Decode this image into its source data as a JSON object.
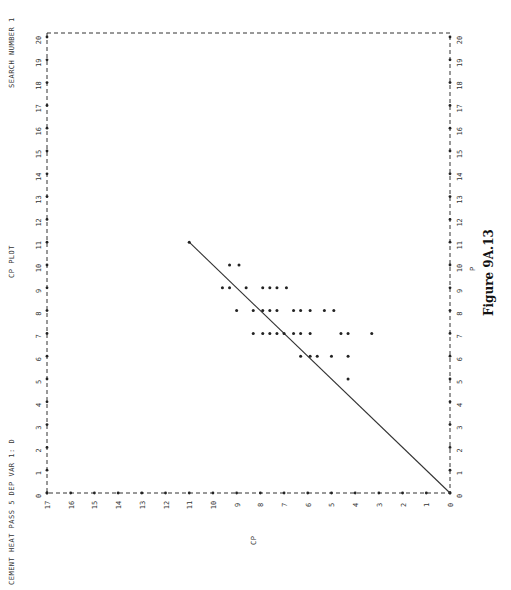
{
  "header": {
    "left": "CEMENT HEAT PASS 5   DEP VAR 1: D",
    "center": "CP PLOT",
    "right": "SEARCH NUMBER 1"
  },
  "caption": "Figure 9A.13",
  "chart_data": {
    "type": "scatter",
    "title": "CP PLOT",
    "orientation": "rotated 90 degrees counter-clockwise on page",
    "xlabel": "P",
    "ylabel": "CP",
    "xlim": [
      0,
      20
    ],
    "ylim": [
      0,
      17
    ],
    "x_ticks": [
      0,
      1,
      2,
      3,
      4,
      5,
      6,
      7,
      8,
      9,
      10,
      11,
      12,
      13,
      14,
      15,
      16,
      17,
      18,
      19,
      20
    ],
    "y_ticks": [
      0,
      1,
      2,
      3,
      4,
      5,
      6,
      7,
      8,
      9,
      10,
      11,
      12,
      13,
      14,
      15,
      16,
      17
    ],
    "grid": false,
    "reference_line": {
      "label": "CP = P",
      "from": [
        0,
        0
      ],
      "to": [
        11,
        11
      ]
    },
    "series": [
      {
        "name": "subsets",
        "points": [
          {
            "p": 11,
            "cp": 11.0
          },
          {
            "p": 10,
            "cp": 9.3
          },
          {
            "p": 10,
            "cp": 8.9
          },
          {
            "p": 9,
            "cp": 9.6
          },
          {
            "p": 9,
            "cp": 9.3
          },
          {
            "p": 9,
            "cp": 8.6
          },
          {
            "p": 9,
            "cp": 7.9
          },
          {
            "p": 9,
            "cp": 7.6
          },
          {
            "p": 9,
            "cp": 7.3
          },
          {
            "p": 9,
            "cp": 6.9
          },
          {
            "p": 8,
            "cp": 9.0
          },
          {
            "p": 8,
            "cp": 8.3
          },
          {
            "p": 8,
            "cp": 7.9
          },
          {
            "p": 8,
            "cp": 7.6
          },
          {
            "p": 8,
            "cp": 7.3
          },
          {
            "p": 8,
            "cp": 6.6
          },
          {
            "p": 8,
            "cp": 6.3
          },
          {
            "p": 8,
            "cp": 5.9
          },
          {
            "p": 8,
            "cp": 5.3
          },
          {
            "p": 8,
            "cp": 4.9
          },
          {
            "p": 7,
            "cp": 8.3
          },
          {
            "p": 7,
            "cp": 7.9
          },
          {
            "p": 7,
            "cp": 7.6
          },
          {
            "p": 7,
            "cp": 7.3
          },
          {
            "p": 7,
            "cp": 7.0
          },
          {
            "p": 7,
            "cp": 6.6
          },
          {
            "p": 7,
            "cp": 6.3
          },
          {
            "p": 7,
            "cp": 5.9
          },
          {
            "p": 7,
            "cp": 4.6
          },
          {
            "p": 7,
            "cp": 4.3
          },
          {
            "p": 7,
            "cp": 3.3
          },
          {
            "p": 6,
            "cp": 6.3
          },
          {
            "p": 6,
            "cp": 5.9
          },
          {
            "p": 6,
            "cp": 5.6
          },
          {
            "p": 6,
            "cp": 5.0
          },
          {
            "p": 6,
            "cp": 4.3
          },
          {
            "p": 5,
            "cp": 4.3
          }
        ]
      }
    ]
  }
}
